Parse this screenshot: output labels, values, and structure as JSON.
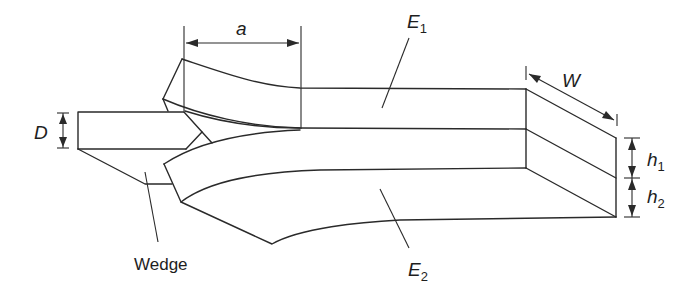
{
  "diagram": {
    "type": "wedge-test-specimen",
    "labels": {
      "crack_length": "a",
      "upper_modulus": "E",
      "upper_modulus_sub": "1",
      "lower_modulus": "E",
      "lower_modulus_sub": "2",
      "width": "W",
      "wedge_thickness": "D",
      "upper_thickness": "h",
      "upper_thickness_sub": "1",
      "lower_thickness": "h",
      "lower_thickness_sub": "2",
      "wedge": "Wedge"
    },
    "colors": {
      "stroke": "#2a2a2a",
      "background": "#ffffff"
    }
  }
}
